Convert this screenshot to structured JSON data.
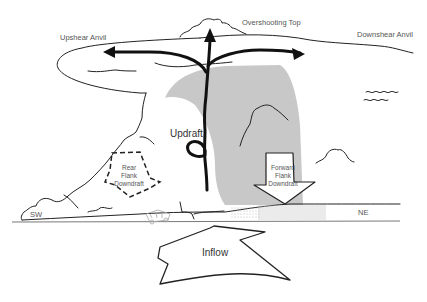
{
  "diagram": {
    "labels": {
      "upshear_anvil": "Upshear Anvil",
      "overshooting_top": "Overshooting Top",
      "downshear_anvil": "Downshear Anvil",
      "updraft": "Updraft",
      "rear_flank_line1": "Rear",
      "rear_flank_line2": "Flank",
      "rear_flank_line3": "Downdraft",
      "forward_flank_line1": "Forward",
      "forward_flank_line2": "Flank",
      "forward_flank_line3": "Downdraft",
      "inflow": "Inflow",
      "direction_sw": "SW",
      "direction_ne": "NE"
    },
    "colors": {
      "line": "#222222",
      "shading": "#c8c8c8",
      "label": "#555555"
    }
  }
}
